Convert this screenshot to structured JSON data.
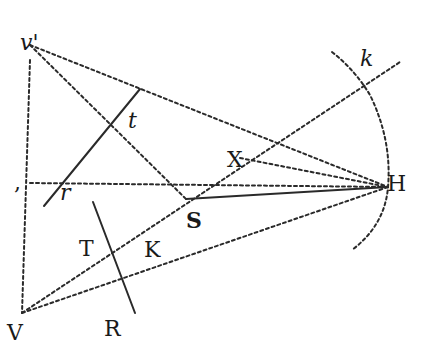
{
  "diagram": {
    "type": "geometric-construction",
    "points": {
      "v_prime": {
        "label": "v'",
        "x": 30,
        "y": 45
      },
      "V": {
        "label": "V",
        "x": 22,
        "y": 313
      },
      "H": {
        "label": "H",
        "x": 388,
        "y": 187
      },
      "S": {
        "label": "S",
        "x": 186,
        "y": 199
      },
      "X": {
        "label": "X",
        "x": 240,
        "y": 158
      },
      "t": {
        "label": "t",
        "x": 140,
        "y": 90
      },
      "r": {
        "label": "r",
        "x": 64,
        "y": 181
      },
      "T": {
        "label": "T",
        "x": 110,
        "y": 253
      },
      "K": {
        "label": "K",
        "x": 140,
        "y": 232
      },
      "R": {
        "label": "R",
        "x": 135,
        "y": 313
      },
      "k": {
        "label": "k",
        "x": 366,
        "y": 77
      },
      "left_mark": {
        "label": ",",
        "x": 18,
        "y": 183
      }
    },
    "labels": [
      {
        "id": "v_prime",
        "text": "v'",
        "x": 20,
        "y": 50,
        "style": "italic"
      },
      {
        "id": "t",
        "text": "t",
        "x": 128,
        "y": 128,
        "style": "italic"
      },
      {
        "id": "r",
        "text": "r",
        "x": 60,
        "y": 200,
        "style": "italic"
      },
      {
        "id": "X",
        "text": "X",
        "x": 227,
        "y": 167,
        "style": "roman"
      },
      {
        "id": "S",
        "text": "S",
        "x": 186,
        "y": 228,
        "style": "bold"
      },
      {
        "id": "T",
        "text": "T",
        "x": 79,
        "y": 256,
        "style": "roman"
      },
      {
        "id": "K",
        "text": "K",
        "x": 144,
        "y": 257,
        "style": "roman"
      },
      {
        "id": "V",
        "text": "V",
        "x": 7,
        "y": 340,
        "style": "roman"
      },
      {
        "id": "R",
        "text": "R",
        "x": 104,
        "y": 336,
        "style": "roman"
      },
      {
        "id": "H",
        "text": "H",
        "x": 387,
        "y": 191,
        "style": "roman"
      },
      {
        "id": "k",
        "text": "k",
        "x": 360,
        "y": 66,
        "style": "italic"
      },
      {
        "id": "comma",
        "text": ",",
        "x": 14,
        "y": 190,
        "style": "roman"
      }
    ],
    "dotted_lines": [
      {
        "name": "v-prime-to-H",
        "x1": 30,
        "y1": 45,
        "x2": 388,
        "y2": 187
      },
      {
        "name": "v-prime-to-S",
        "x1": 30,
        "y1": 45,
        "x2": 186,
        "y2": 199
      },
      {
        "name": "v-prime-to-V",
        "x1": 30,
        "y1": 60,
        "x2": 22,
        "y2": 313
      },
      {
        "name": "horizontal-to-H",
        "x1": 30,
        "y1": 183,
        "x2": 388,
        "y2": 187
      },
      {
        "name": "V-to-k",
        "x1": 22,
        "y1": 313,
        "x2": 400,
        "y2": 62
      },
      {
        "name": "V-to-H",
        "x1": 22,
        "y1": 313,
        "x2": 388,
        "y2": 187
      },
      {
        "name": "X-to-H",
        "x1": 240,
        "y1": 158,
        "x2": 388,
        "y2": 187
      }
    ],
    "solid_lines": [
      {
        "name": "tr-line",
        "x1": 44,
        "y1": 206,
        "x2": 140,
        "y2": 89
      },
      {
        "name": "TR-line",
        "x1": 93,
        "y1": 202,
        "x2": 135,
        "y2": 313
      },
      {
        "name": "S-to-H",
        "x1": 186,
        "y1": 199,
        "x2": 388,
        "y2": 187
      }
    ],
    "arc": {
      "name": "arc-kH",
      "path": "M 332 52 Q 355 70 370 95 Q 392 140 388 187 Q 385 225 352 250"
    }
  }
}
